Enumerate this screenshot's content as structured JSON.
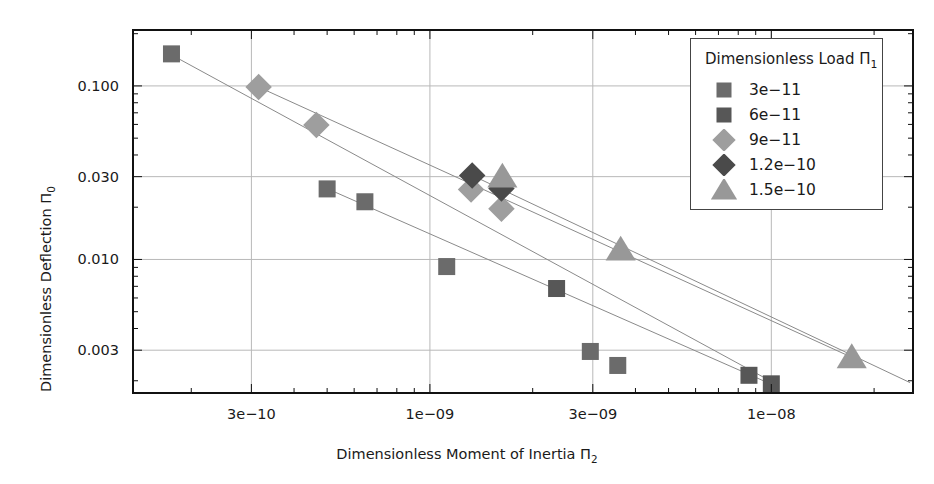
{
  "chart_data": {
    "type": "scatter",
    "title": "",
    "xlabel": "Dimensionless Moment of Inertia Π₂",
    "ylabel": "Dimensionless Deflection Π₀",
    "xscale": "log",
    "yscale": "log",
    "xlim": [
      1.35e-10,
      2.6e-08
    ],
    "ylim": [
      0.0017,
      0.21
    ],
    "grid": true,
    "legend_position": "top-right",
    "legend_title": "Dimensionless Load Π₁",
    "xticks": [
      {
        "value": 3e-10,
        "label": "3e−10"
      },
      {
        "value": 1e-09,
        "label": "1e−09"
      },
      {
        "value": 3e-09,
        "label": "3e−09"
      },
      {
        "value": 1e-08,
        "label": "1e−08"
      }
    ],
    "yticks": [
      {
        "value": 0.1,
        "label": "0.100"
      },
      {
        "value": 0.03,
        "label": "0.030"
      },
      {
        "value": 0.01,
        "label": "0.010"
      },
      {
        "value": 0.003,
        "label": "0.003"
      }
    ],
    "series": [
      {
        "name": "3e−11",
        "label": "3e−11",
        "marker": "square",
        "color": "#6b6b6b",
        "points": [
          {
            "x": 1.75e-10,
            "y": 0.153
          },
          {
            "x": 5e-10,
            "y": 0.0255
          },
          {
            "x": 6.45e-10,
            "y": 0.0215
          },
          {
            "x": 1.12e-09,
            "y": 0.0091
          },
          {
            "x": 2.95e-09,
            "y": 0.00295
          },
          {
            "x": 3.55e-09,
            "y": 0.00245
          }
        ]
      },
      {
        "name": "6e−11",
        "label": "6e−11",
        "marker": "square",
        "color": "#575757",
        "points": [
          {
            "x": 2.35e-09,
            "y": 0.0068
          },
          {
            "x": 8.6e-09,
            "y": 0.00215
          },
          {
            "x": 1e-08,
            "y": 0.00192
          }
        ]
      },
      {
        "name": "9e−11",
        "label": "9e−11",
        "marker": "diamond",
        "color": "#9e9e9e",
        "points": [
          {
            "x": 3.15e-10,
            "y": 0.0985
          },
          {
            "x": 4.65e-10,
            "y": 0.0595
          },
          {
            "x": 1.32e-09,
            "y": 0.0253
          },
          {
            "x": 1.62e-09,
            "y": 0.0196
          }
        ]
      },
      {
        "name": "1.2e−10",
        "label": "1.2e−10",
        "marker": "diamond",
        "color": "#4a4a4a",
        "points": [
          {
            "x": 1.33e-09,
            "y": 0.0305
          },
          {
            "x": 1.62e-09,
            "y": 0.0256
          }
        ]
      },
      {
        "name": "1.5e−10",
        "label": "1.5e−10",
        "marker": "triangle",
        "color": "#989898",
        "points": [
          {
            "x": 1.63e-09,
            "y": 0.03
          },
          {
            "x": 3.62e-09,
            "y": 0.0114
          },
          {
            "x": 1.72e-08,
            "y": 0.00273
          }
        ]
      }
    ],
    "trend_lines": [
      {
        "name": "trend-1",
        "x1": 1.75e-10,
        "y1": 0.151,
        "x2": 1.05e-08,
        "y2": 0.00188
      },
      {
        "name": "trend-2",
        "x1": 3.15e-10,
        "y1": 0.0985,
        "x2": 1.8e-08,
        "y2": 0.00262
      },
      {
        "name": "trend-3",
        "x1": 5e-10,
        "y1": 0.0256,
        "x2": 1.05e-08,
        "y2": 0.00183
      },
      {
        "name": "trend-4",
        "x1": 1.33e-09,
        "y1": 0.0305,
        "x2": 2.55e-08,
        "y2": 0.00195
      }
    ]
  },
  "legend": {
    "title_prefix": "Dimensionless Load Π",
    "title_sub": "1"
  },
  "axes": {
    "x_title_prefix": "Dimensionless Moment of Inertia Π",
    "x_title_sub": "2",
    "y_title_prefix": "Dimensionless Deflection Π",
    "y_title_sub": "0"
  }
}
